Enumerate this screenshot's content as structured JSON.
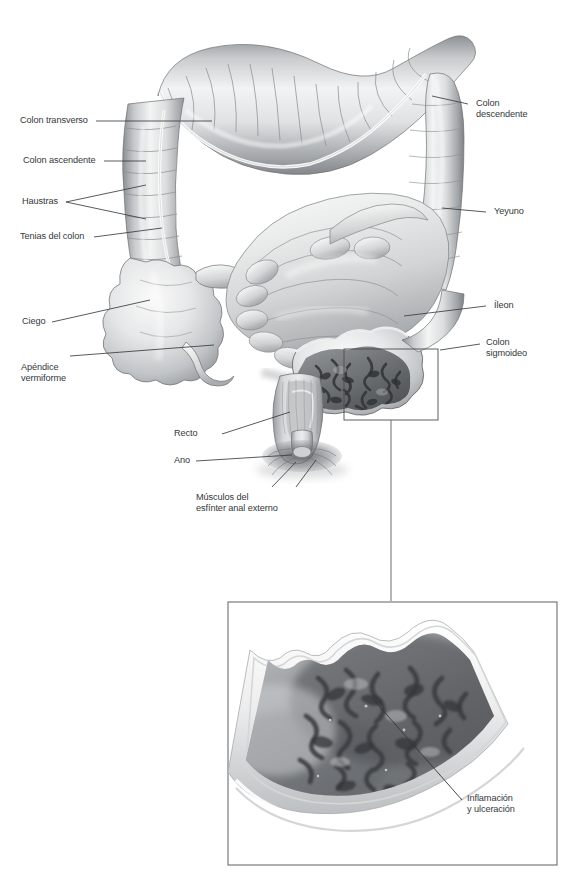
{
  "figure": {
    "background_color": "#ffffff",
    "line_color": "#3a3d40",
    "text_color": "#35383b"
  },
  "labels": {
    "colon_transverso": "Colon transverso",
    "colon_ascendente": "Colon ascendente",
    "haustras": "Haustras",
    "tenias_del_colon": "Tenias del colon",
    "ciego": "Ciego",
    "apendice_vermiforme": "Apéndice\nvermiforme",
    "recto": "Recto",
    "ano": "Ano",
    "musculos_esfinter": "Músculos del\nesfínter anal externo",
    "colon_descendente": "Colon\ndescendente",
    "yeyuno": "Yeyuno",
    "ileon": "Íleon",
    "colon_sigmoideo": "Colon\nsigmoideo",
    "inflamacion_ulceracion": "Inflamación\ny ulceración"
  },
  "inset": {
    "caption": "Inflamación y ulceración",
    "border_color": "#6b6e70"
  },
  "detail_box": {
    "name": "sigmoid-detail-box",
    "border_color": "#4a4d50"
  }
}
